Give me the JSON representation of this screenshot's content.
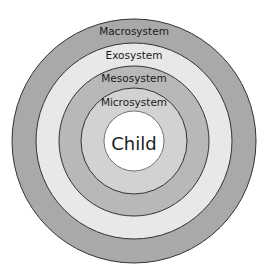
{
  "diagram": {
    "type": "concentric-circles",
    "rings": [
      {
        "label": "Macrosystem",
        "color": "#a9a9a9"
      },
      {
        "label": "Exosystem",
        "color": "#e8e8e8"
      },
      {
        "label": "Mesosystem",
        "color": "#b8b8b8"
      },
      {
        "label": "Microsystem",
        "color": "#d2d2d2"
      }
    ],
    "center": {
      "label": "Child",
      "color": "#ffffff"
    }
  }
}
